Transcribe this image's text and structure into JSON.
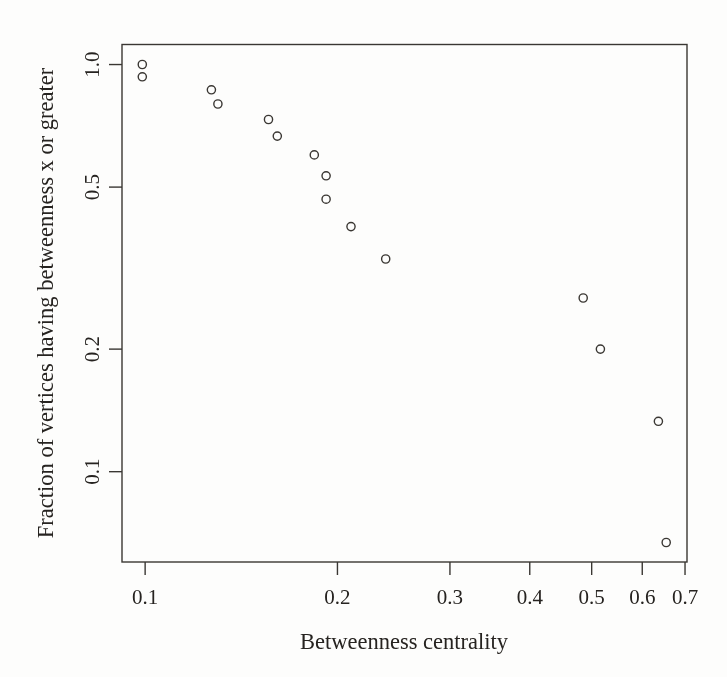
{
  "figure": {
    "background": "#fdfdfc",
    "ink_color": "#3a3733",
    "text_color": "#262320",
    "marker_shape": "open-circle"
  },
  "chart_data": {
    "type": "scatter",
    "title": "",
    "xlabel": "Betweenness centrality",
    "ylabel": "Fraction of vertices having betweenness x or greater",
    "x_scale": "log",
    "y_scale": "log",
    "xlim": [
      0.092,
      0.705
    ],
    "ylim": [
      0.06,
      1.12
    ],
    "x_ticks": [
      "0.1",
      "0.2",
      "0.3",
      "0.4",
      "0.5",
      "0.6",
      "0.7"
    ],
    "y_ticks": [
      "1.0",
      "0.5",
      "0.2",
      "0.1"
    ],
    "grid": false,
    "legend": "none",
    "points": [
      {
        "x": 0.099,
        "y": 1.0
      },
      {
        "x": 0.099,
        "y": 0.933
      },
      {
        "x": 0.127,
        "y": 0.867
      },
      {
        "x": 0.13,
        "y": 0.8
      },
      {
        "x": 0.156,
        "y": 0.733
      },
      {
        "x": 0.161,
        "y": 0.667
      },
      {
        "x": 0.184,
        "y": 0.6
      },
      {
        "x": 0.192,
        "y": 0.533
      },
      {
        "x": 0.192,
        "y": 0.467
      },
      {
        "x": 0.21,
        "y": 0.4
      },
      {
        "x": 0.238,
        "y": 0.333
      },
      {
        "x": 0.485,
        "y": 0.267
      },
      {
        "x": 0.516,
        "y": 0.2
      },
      {
        "x": 0.636,
        "y": 0.133
      },
      {
        "x": 0.654,
        "y": 0.067
      }
    ]
  }
}
